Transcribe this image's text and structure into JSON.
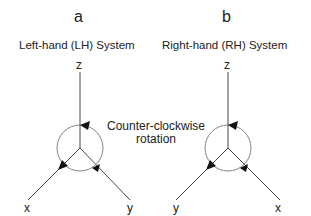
{
  "panels": [
    {
      "letter": "a",
      "title": "Left-hand (LH) System",
      "axes": {
        "top": "z",
        "bottom_left": "x",
        "bottom_right": "y"
      }
    },
    {
      "letter": "b",
      "title": "Right-hand (RH) System",
      "axes": {
        "top": "z",
        "bottom_left": "y",
        "bottom_right": "x"
      }
    }
  ],
  "annotation": {
    "line1": "Counter-clockwise",
    "line2": "rotation"
  },
  "colors": {
    "line": "#333333",
    "circle": "#666666",
    "text": "#222222"
  }
}
